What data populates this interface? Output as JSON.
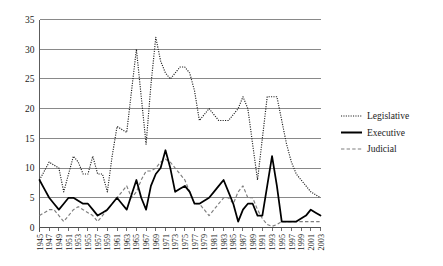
{
  "chart_data": {
    "type": "line",
    "title": "",
    "subtitle": "",
    "xlabel": "",
    "ylabel": "",
    "xlim": [
      1945,
      2003
    ],
    "ylim": [
      0,
      35
    ],
    "ytick_values": [
      0,
      5,
      10,
      15,
      20,
      25,
      30,
      35
    ],
    "ytick_labels": [
      "0",
      "5",
      "10",
      "15",
      "20",
      "25",
      "30",
      "35"
    ],
    "grid": true,
    "grid_axis": "y",
    "legend_position": "right",
    "x": [
      1945,
      1946,
      1947,
      1948,
      1949,
      1950,
      1951,
      1952,
      1953,
      1954,
      1955,
      1956,
      1957,
      1958,
      1959,
      1960,
      1961,
      1962,
      1963,
      1964,
      1965,
      1966,
      1967,
      1968,
      1969,
      1970,
      1971,
      1972,
      1973,
      1974,
      1975,
      1976,
      1977,
      1978,
      1979,
      1980,
      1981,
      1982,
      1983,
      1984,
      1985,
      1986,
      1987,
      1988,
      1989,
      1990,
      1991,
      1992,
      1993,
      1994,
      1995,
      1996,
      1997,
      1998,
      1999,
      2000,
      2001,
      2002,
      2003
    ],
    "xtick_labels": [
      "1945",
      "1947",
      "1949",
      "1951",
      "1953",
      "1955",
      "1957",
      "1959",
      "1961",
      "1963",
      "1965",
      "1967",
      "1969",
      "1971",
      "1973",
      "1975",
      "1977",
      "1979",
      "1981",
      "1983",
      "1985",
      "1987",
      "1989",
      "1991",
      "1993",
      "1995",
      "1997",
      "1999",
      "2001",
      "2003"
    ],
    "series": [
      {
        "name": "Legislative",
        "style": "dotted",
        "color": "#1c1c1c",
        "values": [
          8,
          9.5,
          11,
          10.5,
          10,
          6,
          9,
          12,
          11,
          9,
          9,
          12,
          9,
          9,
          6,
          12,
          17,
          16.5,
          16,
          23,
          30,
          22,
          14,
          24,
          32,
          28,
          26,
          25,
          26,
          27,
          27,
          26,
          23,
          18,
          19,
          20,
          19,
          18,
          18,
          18,
          19,
          20,
          22,
          20,
          14,
          8,
          15,
          22,
          22,
          22,
          18,
          14,
          11,
          9,
          8,
          7,
          6,
          5.5,
          5
        ]
      },
      {
        "name": "Executive",
        "style": "solid",
        "color": "#000000",
        "values": [
          8,
          6.5,
          5,
          4,
          3,
          4,
          5,
          5,
          4.5,
          4,
          4,
          3,
          2,
          2.5,
          3,
          4,
          5,
          4,
          3,
          5.5,
          8,
          5,
          3,
          7,
          9,
          10,
          13,
          10,
          6,
          6.5,
          7,
          6,
          4,
          4,
          4.5,
          5,
          6,
          7,
          8,
          6,
          4,
          1,
          3,
          4,
          4,
          2,
          2,
          7,
          12,
          7,
          1,
          1,
          1,
          1,
          1.5,
          2,
          3,
          2.5,
          2
        ]
      },
      {
        "name": "Judicial",
        "style": "dashed",
        "color": "#7e7e7e",
        "values": [
          2,
          2.5,
          3,
          3,
          2,
          1,
          2,
          3,
          3.5,
          3,
          2.5,
          2,
          1,
          2,
          3,
          4,
          5,
          6,
          7,
          5,
          6,
          8,
          9.5,
          9.5,
          10,
          11,
          11.5,
          11,
          10,
          9,
          8,
          6,
          4,
          4,
          3,
          2,
          3,
          4,
          5,
          5,
          4,
          6,
          7,
          5,
          5,
          3,
          1.5,
          0.5,
          0.2,
          0.5,
          1,
          1,
          1,
          1,
          1,
          1,
          1,
          1,
          1
        ]
      }
    ]
  },
  "legend": {
    "items": [
      {
        "label": "Legislative"
      },
      {
        "label": "Executive"
      },
      {
        "label": "Judicial"
      }
    ]
  }
}
